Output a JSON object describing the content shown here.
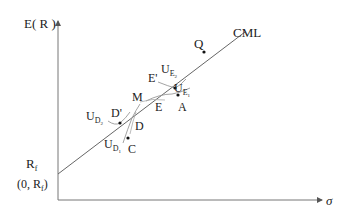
{
  "diagram": {
    "type": "capital-market-line",
    "axes": {
      "y_label": "E( R )",
      "x_label": "σ",
      "intercept_label": "R",
      "intercept_label_sub": "f",
      "intercept_coord": "(0, R",
      "intercept_coord_sub": "f",
      "intercept_coord_close": ")"
    },
    "line_label": "CML",
    "points": {
      "Q": "Q",
      "E_prime": "E'",
      "M": "M",
      "D_prime": "D'",
      "E": "E",
      "A": "A",
      "D": "D",
      "C": "C"
    },
    "utility_labels": {
      "UE2": {
        "base": "U",
        "sub": "E",
        "subsub": "2"
      },
      "UE1": {
        "base": "U",
        "sub": "E",
        "subsub": "1"
      },
      "UD2": {
        "base": "U",
        "sub": "D",
        "subsub": "2"
      },
      "UD1": {
        "base": "U",
        "sub": "D",
        "subsub": "1"
      }
    },
    "colors": {
      "axis": "#777777",
      "line": "#666666",
      "text": "#222222",
      "point": "#111111"
    }
  }
}
